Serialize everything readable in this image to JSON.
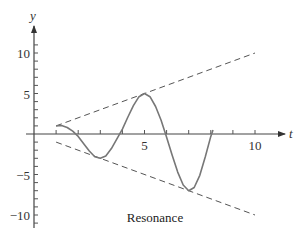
{
  "chart_data": {
    "type": "line",
    "title": "",
    "caption": "Resonance",
    "xlabel": "t",
    "ylabel": "y",
    "xlim": [
      0,
      11.5
    ],
    "ylim": [
      -11.5,
      13
    ],
    "grid": false,
    "x_ticks": [
      1,
      2,
      3,
      4,
      5,
      6,
      7,
      8,
      9,
      10
    ],
    "x_tick_labels": [
      {
        "value": 5,
        "label": "5"
      },
      {
        "value": 10,
        "label": "10"
      }
    ],
    "y_ticks": [
      -11,
      -10,
      -9,
      -8,
      -7,
      -6,
      -5,
      -4,
      -3,
      -2,
      -1,
      1,
      2,
      3,
      4,
      5,
      6,
      7,
      8,
      9,
      10,
      11
    ],
    "y_tick_labels": [
      {
        "value": 10,
        "label": "10"
      },
      {
        "value": 5,
        "label": "5"
      },
      {
        "value": -5,
        "label": "−5"
      },
      {
        "value": -10,
        "label": "−10"
      }
    ],
    "series": [
      {
        "name": "upper envelope y = t",
        "style": "dashed",
        "x": [
          1,
          10
        ],
        "y": [
          1,
          10
        ]
      },
      {
        "name": "lower envelope y = -t",
        "style": "dashed",
        "x": [
          1,
          10
        ],
        "y": [
          -1,
          -10
        ]
      },
      {
        "name": "resonant solution",
        "style": "solid",
        "x": [
          1.0,
          1.25,
          1.5,
          1.75,
          2.0,
          2.25,
          2.5,
          2.75,
          3.0,
          3.25,
          3.5,
          3.75,
          4.0,
          4.25,
          4.5,
          4.75,
          5.0,
          5.25,
          5.5,
          5.75,
          6.0,
          6.25,
          6.5,
          6.75,
          7.0,
          7.25,
          7.5,
          7.75,
          8.0,
          8.1
        ],
        "y": [
          1.0,
          1.05,
          0.8,
          0.35,
          -0.3,
          -1.2,
          -2.1,
          -2.8,
          -3.0,
          -2.7,
          -1.8,
          -0.6,
          0.6,
          2.1,
          3.5,
          4.6,
          5.0,
          4.6,
          3.4,
          1.7,
          -0.4,
          -2.6,
          -4.7,
          -6.3,
          -7.0,
          -6.6,
          -5.1,
          -2.8,
          -0.3,
          0.5
        ]
      }
    ]
  }
}
